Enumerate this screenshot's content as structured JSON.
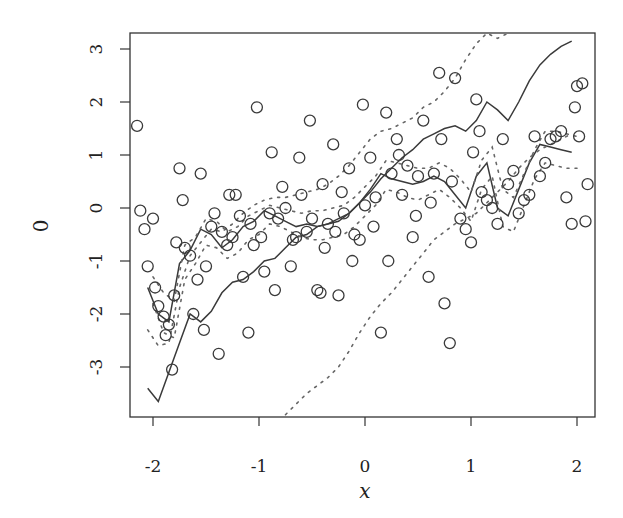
{
  "chart_data": {
    "type": "scatter",
    "title": "",
    "xlabel": "x",
    "ylabel": "0",
    "xlim": [
      -2.2,
      2.15
    ],
    "ylim": [
      -3.9,
      3.3
    ],
    "grid": false,
    "legend": null,
    "x_ticks": [
      -2,
      -1,
      0,
      1,
      2
    ],
    "x_tick_labels": [
      "-2",
      "-1",
      "0",
      "1",
      "2"
    ],
    "y_ticks": [
      -3,
      -2,
      -1,
      0,
      1,
      2,
      3
    ],
    "y_tick_labels": [
      "-3",
      "-2",
      "-1",
      "0",
      "1",
      "2",
      "3"
    ],
    "points": {
      "marker": "open-circle",
      "x": [
        -2.15,
        -2.12,
        -2.08,
        -2.05,
        -2.0,
        -1.98,
        -1.95,
        -1.9,
        -1.88,
        -1.85,
        -1.82,
        -1.8,
        -1.78,
        -1.75,
        -1.72,
        -1.7,
        -1.65,
        -1.62,
        -1.58,
        -1.55,
        -1.52,
        -1.5,
        -1.45,
        -1.42,
        -1.38,
        -1.35,
        -1.3,
        -1.28,
        -1.25,
        -1.22,
        -1.18,
        -1.15,
        -1.1,
        -1.08,
        -1.05,
        -1.02,
        -0.98,
        -0.95,
        -0.9,
        -0.88,
        -0.85,
        -0.82,
        -0.78,
        -0.75,
        -0.7,
        -0.68,
        -0.65,
        -0.62,
        -0.6,
        -0.55,
        -0.52,
        -0.5,
        -0.45,
        -0.42,
        -0.4,
        -0.38,
        -0.35,
        -0.3,
        -0.28,
        -0.25,
        -0.22,
        -0.2,
        -0.15,
        -0.12,
        -0.1,
        -0.05,
        -0.02,
        0.0,
        0.05,
        0.08,
        0.1,
        0.15,
        0.2,
        0.22,
        0.25,
        0.3,
        0.32,
        0.35,
        0.4,
        0.45,
        0.48,
        0.5,
        0.55,
        0.6,
        0.62,
        0.65,
        0.7,
        0.72,
        0.75,
        0.8,
        0.82,
        0.85,
        0.9,
        0.95,
        1.0,
        1.02,
        1.05,
        1.08,
        1.1,
        1.15,
        1.2,
        1.25,
        1.3,
        1.35,
        1.4,
        1.45,
        1.5,
        1.55,
        1.6,
        1.65,
        1.7,
        1.75,
        1.8,
        1.85,
        1.9,
        1.95,
        1.98,
        2.0,
        2.02,
        2.05,
        2.08,
        2.1
      ],
      "y": [
        1.55,
        -0.05,
        -0.4,
        -1.1,
        -0.2,
        -1.5,
        -1.85,
        -2.05,
        -2.4,
        -2.2,
        -3.05,
        -1.65,
        -0.65,
        0.75,
        0.15,
        -0.75,
        -0.9,
        -2.0,
        -1.35,
        0.65,
        -2.3,
        -1.1,
        -0.35,
        -0.1,
        -2.75,
        -0.45,
        -0.7,
        0.25,
        -0.55,
        0.25,
        -0.15,
        -1.3,
        -2.35,
        -0.3,
        -0.7,
        1.9,
        -0.55,
        -1.2,
        -0.1,
        1.05,
        -1.55,
        -0.2,
        0.4,
        0.0,
        -1.1,
        -0.6,
        -0.55,
        0.95,
        0.25,
        -0.45,
        1.65,
        -0.2,
        -1.55,
        -1.6,
        0.45,
        -0.75,
        -0.3,
        1.2,
        -0.45,
        -1.65,
        0.3,
        -0.1,
        0.75,
        -1.0,
        -0.5,
        -0.6,
        1.95,
        0.05,
        0.95,
        -0.35,
        0.2,
        -2.35,
        1.8,
        -1.0,
        0.65,
        1.3,
        1.0,
        0.25,
        0.8,
        -0.55,
        -0.15,
        0.6,
        1.65,
        -1.3,
        0.1,
        0.65,
        2.55,
        1.3,
        -1.8,
        -2.55,
        0.5,
        2.45,
        -0.2,
        -0.4,
        -0.65,
        1.05,
        2.05,
        1.45,
        0.3,
        0.15,
        0.0,
        -0.3,
        1.3,
        0.45,
        0.7,
        -0.1,
        0.15,
        0.25,
        1.35,
        0.6,
        0.85,
        1.3,
        1.35,
        1.45,
        0.2,
        -0.3,
        1.9,
        2.3,
        1.35,
        2.35,
        -0.25,
        0.45
      ]
    },
    "series": [
      {
        "name": "fit-lower-solid",
        "style": "solid",
        "x": [
          -2.05,
          -1.95,
          -1.85,
          -1.75,
          -1.65,
          -1.55,
          -1.45,
          -1.35,
          -1.25,
          -1.15,
          -1.05,
          -0.95,
          -0.85,
          -0.75,
          -0.65,
          -0.55,
          -0.45,
          -0.35,
          -0.25,
          -0.15,
          -0.05,
          0.05,
          0.15,
          0.25,
          0.35,
          0.45,
          0.55,
          0.65,
          0.75,
          0.85,
          0.95,
          1.05,
          1.15,
          1.25,
          1.35,
          1.45,
          1.55,
          1.65,
          1.75,
          1.85,
          1.95
        ],
        "y": [
          -3.4,
          -3.65,
          -3.1,
          -2.55,
          -2.0,
          -2.15,
          -1.95,
          -1.6,
          -1.4,
          -1.35,
          -1.2,
          -1.0,
          -0.95,
          -0.75,
          -0.55,
          -0.5,
          -0.35,
          -0.3,
          -0.2,
          -0.1,
          0.1,
          0.3,
          0.55,
          0.75,
          0.95,
          1.1,
          1.3,
          1.4,
          1.5,
          1.55,
          1.45,
          1.65,
          2.0,
          1.85,
          1.65,
          2.0,
          2.4,
          2.7,
          2.9,
          3.05,
          3.15
        ]
      },
      {
        "name": "fit-upper-solid",
        "style": "solid",
        "x": [
          -2.05,
          -1.95,
          -1.85,
          -1.75,
          -1.65,
          -1.55,
          -1.45,
          -1.35,
          -1.25,
          -1.15,
          -1.05,
          -0.95,
          -0.85,
          -0.75,
          -0.65,
          -0.55,
          -0.45,
          -0.35,
          -0.25,
          -0.15,
          -0.05,
          0.05,
          0.15,
          0.25,
          0.35,
          0.45,
          0.55,
          0.65,
          0.75,
          0.85,
          0.95,
          1.05,
          1.15,
          1.25,
          1.35,
          1.45,
          1.55,
          1.65,
          1.75,
          1.85,
          1.95
        ],
        "y": [
          -1.5,
          -2.0,
          -2.15,
          -1.05,
          -0.8,
          -0.4,
          -0.5,
          -0.75,
          -0.6,
          -0.35,
          -0.25,
          -0.05,
          -0.15,
          -0.25,
          -0.35,
          -0.3,
          -0.35,
          -0.3,
          -0.25,
          -0.1,
          0.1,
          0.35,
          0.65,
          0.55,
          0.5,
          0.45,
          0.5,
          0.6,
          0.5,
          0.25,
          0.0,
          0.6,
          0.85,
          0.0,
          -0.15,
          0.35,
          0.85,
          1.2,
          1.15,
          1.1,
          1.05
        ]
      },
      {
        "name": "band-upper-dotted",
        "style": "dotted",
        "x": [
          -2.05,
          -1.95,
          -1.85,
          -1.75,
          -1.65,
          -1.55,
          -1.45,
          -1.35,
          -1.25,
          -1.15,
          -1.05,
          -0.95,
          -0.85,
          -0.75,
          -0.65,
          -0.55,
          -0.45,
          -0.35,
          -0.25,
          -0.15,
          -0.05,
          0.05,
          0.15,
          0.25,
          0.35,
          0.45,
          0.55,
          0.65,
          0.75,
          0.85,
          0.95,
          1.05,
          1.15,
          1.25,
          1.35,
          1.45,
          1.55
        ],
        "y": [
          -2.3,
          -2.6,
          -2.55,
          -1.5,
          -0.9,
          -0.65,
          -0.4,
          -0.45,
          -0.3,
          -0.1,
          0.05,
          0.15,
          0.2,
          0.2,
          0.25,
          0.3,
          0.35,
          0.45,
          0.6,
          0.8,
          1.05,
          1.3,
          1.45,
          1.5,
          1.6,
          1.7,
          1.9,
          2.0,
          2.2,
          2.45,
          2.8,
          3.1,
          3.3,
          3.2,
          3.3,
          3.3,
          3.3
        ]
      },
      {
        "name": "band-lower-dotted",
        "style": "dotted",
        "x": [
          -0.75,
          -0.65,
          -0.55,
          -0.45,
          -0.35,
          -0.25,
          -0.15,
          -0.05,
          0.05,
          0.15,
          0.25,
          0.35,
          0.45,
          0.55,
          0.65,
          0.75,
          0.85,
          0.95,
          1.05,
          1.15,
          1.25,
          1.35,
          1.45,
          1.55,
          1.65,
          1.75,
          1.85,
          1.95
        ],
        "y": [
          -3.9,
          -3.7,
          -3.5,
          -3.35,
          -3.2,
          -3.0,
          -2.7,
          -2.35,
          -2.05,
          -1.8,
          -1.6,
          -1.35,
          -1.1,
          -0.85,
          -0.6,
          -0.45,
          -0.3,
          -0.2,
          -0.1,
          0.1,
          0.3,
          0.5,
          0.75,
          0.95,
          1.1,
          1.2,
          1.3,
          1.4
        ]
      },
      {
        "name": "inner-band-upper-dotted",
        "style": "dotted",
        "x": [
          -2.0,
          -1.9,
          -1.8,
          -1.7,
          -1.6,
          -1.5,
          -1.4,
          -1.3,
          -1.2,
          -1.1,
          -1.0,
          -0.9,
          -0.8,
          -0.7,
          -0.6,
          -0.5,
          -0.4,
          -0.3,
          -0.2,
          -0.1,
          0.0,
          0.1,
          0.2,
          0.3,
          0.4,
          0.5,
          0.6,
          0.7,
          0.8,
          0.9,
          1.0,
          1.1,
          1.2,
          1.3,
          1.4,
          1.5,
          1.6,
          1.7,
          1.8,
          1.9,
          2.0
        ],
        "y": [
          -1.3,
          -1.6,
          -1.75,
          -0.7,
          -0.55,
          -0.2,
          -0.25,
          -0.45,
          -0.35,
          -0.15,
          -0.05,
          0.05,
          0.0,
          -0.05,
          -0.1,
          -0.05,
          -0.05,
          0.0,
          0.05,
          0.2,
          0.4,
          0.6,
          0.9,
          0.85,
          0.8,
          0.75,
          0.75,
          0.85,
          0.75,
          0.55,
          0.3,
          0.9,
          1.15,
          0.35,
          0.2,
          0.65,
          1.1,
          1.45,
          1.45,
          1.4,
          1.35
        ]
      },
      {
        "name": "inner-band-lower-dotted",
        "style": "dotted",
        "x": [
          -2.0,
          -1.9,
          -1.8,
          -1.7,
          -1.6,
          -1.5,
          -1.4,
          -1.3,
          -1.2,
          -1.1,
          -1.0,
          -0.9,
          -0.8,
          -0.7,
          -0.6,
          -0.5,
          -0.4,
          -0.3,
          -0.2,
          -0.1,
          0.0,
          0.1,
          0.2,
          0.3,
          0.4,
          0.5,
          0.6,
          0.7,
          0.8,
          0.9,
          1.0,
          1.1,
          1.2,
          1.3,
          1.4,
          1.5,
          1.6,
          1.7,
          1.8,
          1.9,
          2.0
        ],
        "y": [
          -1.8,
          -2.35,
          -2.45,
          -1.35,
          -1.05,
          -0.7,
          -0.75,
          -0.95,
          -0.85,
          -0.6,
          -0.5,
          -0.3,
          -0.35,
          -0.45,
          -0.55,
          -0.6,
          -0.6,
          -0.55,
          -0.5,
          -0.35,
          -0.15,
          0.05,
          0.35,
          0.3,
          0.2,
          0.15,
          0.25,
          0.35,
          0.2,
          0.0,
          -0.25,
          0.35,
          0.6,
          -0.35,
          -0.45,
          0.05,
          0.55,
          0.85,
          0.8,
          0.75,
          0.75
        ]
      }
    ]
  },
  "plot": {
    "box": {
      "left": 130,
      "top": 33,
      "right": 595,
      "bottom": 417
    },
    "x_origin_px": 365,
    "x_scale": 106,
    "y_origin_px": 208,
    "y_scale": 53,
    "line_color": "#3a3a3a",
    "point_color": "#3a3a3a",
    "dotted_color": "#666666"
  }
}
